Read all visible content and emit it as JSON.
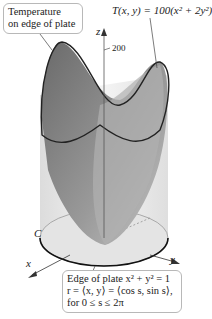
{
  "callouts": {
    "temperature": {
      "line1": "Temperature",
      "line2": "on edge of plate"
    },
    "edge": {
      "line1": "Edge of plate x² + y² = 1",
      "line2": "r = ⟨x, y⟩ = ⟨cos s, sin s⟩,",
      "line3": "for 0 ≤ s ≤ 2π"
    }
  },
  "formula": "T(x, y) = 100(x² + 2y²)",
  "axes": {
    "z": "z",
    "x": "x",
    "y": "y",
    "z_tick": "200"
  },
  "curve_label": "C",
  "colors": {
    "surface": "#8f8f8f",
    "surface_dark": "#6e6e6e",
    "cylinder": "#e6e6e6",
    "outline": "#222222"
  }
}
